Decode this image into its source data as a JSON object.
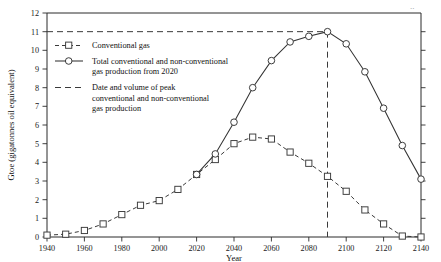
{
  "chart_data": {
    "type": "line",
    "title": "",
    "xlabel": "Year",
    "ylabel": "Gtoe (gigatonnes oil equivalent)",
    "xlim": [
      1940,
      2140
    ],
    "ylim": [
      0,
      12
    ],
    "xticks": [
      1940,
      1960,
      1980,
      2000,
      2020,
      2040,
      2060,
      2080,
      2100,
      2120,
      2140
    ],
    "yticks": [
      0,
      1,
      2,
      3,
      4,
      5,
      6,
      7,
      8,
      9,
      10,
      11,
      12
    ],
    "grid": false,
    "legend_position": "upper-left-inside",
    "series": [
      {
        "name": "Conventional gas",
        "marker": "square",
        "linestyle": "dashed",
        "x": [
          1940,
          1950,
          1960,
          1970,
          1980,
          1990,
          2000,
          2010,
          2020,
          2030,
          2040,
          2050,
          2060,
          2070,
          2080,
          2090,
          2100,
          2110,
          2120,
          2130,
          2140
        ],
        "values": [
          0.1,
          0.15,
          0.35,
          0.7,
          1.2,
          1.7,
          1.95,
          2.55,
          3.35,
          4.15,
          5.0,
          5.35,
          5.25,
          4.55,
          3.95,
          3.25,
          2.45,
          1.45,
          0.7,
          0.05,
          0.0
        ]
      },
      {
        "name": "Total conventional and non-conventional gas production from 2020",
        "marker": "circle",
        "linestyle": "solid",
        "x": [
          2020,
          2030,
          2040,
          2050,
          2060,
          2070,
          2080,
          2090,
          2100,
          2110,
          2120,
          2130,
          2140
        ],
        "values": [
          3.35,
          4.45,
          6.15,
          8.0,
          9.45,
          10.45,
          10.75,
          11.0,
          10.35,
          8.85,
          6.9,
          4.9,
          3.1
        ]
      }
    ],
    "annotations": [
      {
        "name": "peak-guide",
        "label": "Date and volume of peak conventional and non-conventional gas production",
        "x": 2090,
        "y": 11.0,
        "style": "dashed"
      }
    ]
  },
  "axes": {
    "y_title": "Gtoe (gigatonnes oil equivalent)",
    "x_title": "Year",
    "y_tick_labels": [
      "0",
      "1",
      "2",
      "3",
      "4",
      "5",
      "6",
      "7",
      "8",
      "9",
      "10",
      "11",
      "12"
    ],
    "x_tick_labels": [
      "1940",
      "1960",
      "1980",
      "2000",
      "2020",
      "2040",
      "2060",
      "2080",
      "2100",
      "2120",
      "2140"
    ]
  },
  "legend": {
    "entries": [
      {
        "id": "conventional-gas",
        "marker": "square",
        "linestyle": "dashed",
        "lines": [
          "Conventional gas"
        ]
      },
      {
        "id": "total-gas-production",
        "marker": "circle",
        "linestyle": "solid",
        "lines": [
          "Total conventional and non-conventional",
          "gas production from 2020"
        ]
      },
      {
        "id": "peak-date-volume",
        "marker": "none",
        "linestyle": "dashed",
        "lines": [
          "Date and volume of peak",
          "conventional and non-conventional",
          "gas production"
        ]
      }
    ]
  },
  "page_artifact": {
    "corner_mark": ".."
  },
  "colors": {
    "line": "#333333",
    "dashed_line": "#3a3a3a",
    "marker_fill": "#ffffff",
    "text": "#111111",
    "axis": "#2b2b2b",
    "background": "#ffffff"
  }
}
